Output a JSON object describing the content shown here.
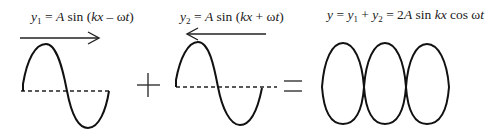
{
  "equations": {
    "wave1": {
      "lhs": "y",
      "sub": "1",
      "rhs_a": " = ",
      "amp": "A",
      "fn": " sin (",
      "k": "k",
      "x": "x",
      "op": " – ",
      "w": "ω",
      "t": "t",
      "close": ")"
    },
    "wave2": {
      "lhs": "y",
      "sub": "2",
      "rhs_a": " = ",
      "amp": "A",
      "fn": " sin (",
      "k": "k",
      "x": "x",
      "op": " + ",
      "w": "ω",
      "t": "t",
      "close": ")"
    },
    "sum": {
      "y": "y",
      "eq1": " =  ",
      "y1": "y",
      "s1": "1",
      "plus": " + ",
      "y2": "y",
      "s2": "2",
      "eq2": " = 2",
      "amp": "A",
      "sin": " sin ",
      "kx": "kx",
      "cos": " cos ω",
      "t": "t"
    }
  },
  "operators": {
    "plus": "+",
    "equals": "="
  },
  "arrows": {
    "wave1_direction": "right",
    "wave2_direction": "left"
  },
  "colors": {
    "stroke": "#111111",
    "background": "#ffffff"
  }
}
